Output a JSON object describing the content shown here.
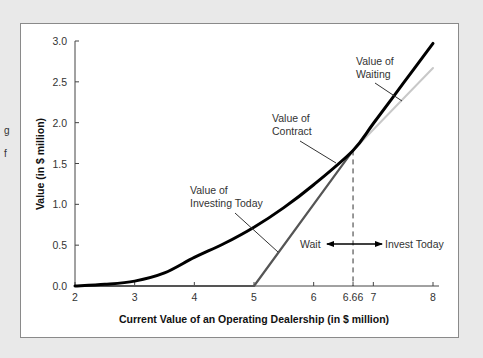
{
  "page_fragments": {
    "left_cut_1": "g",
    "left_cut_2": "f"
  },
  "chart_data": {
    "type": "line",
    "title": "",
    "xlabel": "Current Value of an Operating Dealership (in $ million)",
    "ylabel": "Value (in $ million)",
    "xlim": [
      2,
      8
    ],
    "ylim": [
      0,
      3.0
    ],
    "x_ticks": [
      "2",
      "3",
      "4",
      "5",
      "6",
      "6.66",
      "7",
      "8"
    ],
    "y_ticks": [
      "0.0",
      "0.5",
      "1.0",
      "1.5",
      "2.0",
      "2.5",
      "3.0"
    ],
    "grid": false,
    "series": [
      {
        "name": "Value of Contract",
        "color": "#000000",
        "x": [
          2,
          2.5,
          3,
          3.5,
          4,
          4.5,
          5,
          5.5,
          6,
          6.66,
          7,
          7.5,
          8
        ],
        "y": [
          0.0,
          0.02,
          0.06,
          0.16,
          0.35,
          0.52,
          0.72,
          0.96,
          1.24,
          1.66,
          1.99,
          2.48,
          2.97
        ]
      },
      {
        "name": "Value of Investing Today",
        "color": "#555555",
        "x": [
          2,
          5,
          6.66
        ],
        "y": [
          0.0,
          0.0,
          1.66
        ]
      },
      {
        "name": "Value of Investing Today (extended)",
        "color": "#c8c8c8",
        "x": [
          6.66,
          8
        ],
        "y": [
          1.66,
          2.67
        ]
      }
    ],
    "annotations": [
      {
        "text": [
          "Value of",
          "Waiting"
        ],
        "points_to": [
          7.35,
          2.35
        ]
      },
      {
        "text": [
          "Value of",
          "Contract"
        ],
        "points_to": [
          6.25,
          1.38
        ]
      },
      {
        "text": [
          "Value of",
          "Investing Today"
        ],
        "points_to": [
          5.5,
          0.5
        ]
      },
      {
        "text": "Wait",
        "region": "left of 6.66"
      },
      {
        "text": "Invest Today",
        "region": "right of 6.66"
      }
    ],
    "threshold": {
      "x": 6.66,
      "style": "dashed"
    }
  },
  "labels": {
    "waiting_1": "Value of",
    "waiting_2": "Waiting",
    "contract_1": "Value of",
    "contract_2": "Contract",
    "investing_1": "Value of",
    "investing_2": "Investing Today",
    "wait": "Wait",
    "invest_today": "Invest Today"
  }
}
